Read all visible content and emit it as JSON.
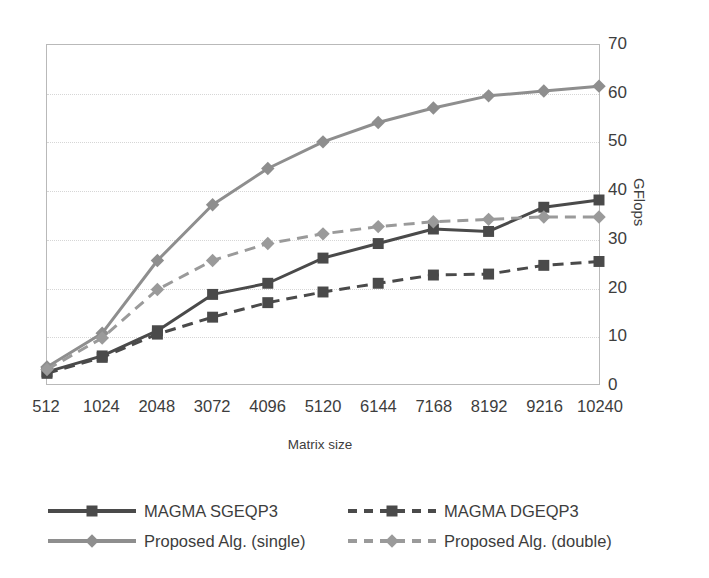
{
  "chart_data": {
    "type": "line",
    "title": "",
    "xlabel": "Matrix size",
    "ylabel": "GFlops",
    "grid": true,
    "legend_position": "bottom",
    "ylim": [
      0,
      70
    ],
    "ytick_step": 10,
    "yticks": [
      "70",
      "60",
      "50",
      "40",
      "30",
      "20",
      "10",
      "0"
    ],
    "categories": [
      "512",
      "1024",
      "2048",
      "3072",
      "4096",
      "5120",
      "6144",
      "7168",
      "8192",
      "9216",
      "10240"
    ],
    "series": [
      {
        "name": "MAGMA SGEQP3",
        "color": "#4a4a4a",
        "dash": "solid",
        "marker": "square",
        "values": [
          2.5,
          5.8,
          11.0,
          18.5,
          20.8,
          26.0,
          29.0,
          32.0,
          31.5,
          36.5,
          38.0
        ]
      },
      {
        "name": "MAGMA DGEQP3",
        "color": "#4a4a4a",
        "dash": "dashed",
        "marker": "square",
        "values": [
          2.2,
          5.5,
          10.3,
          13.8,
          16.8,
          19.0,
          20.8,
          22.5,
          22.7,
          24.5,
          25.3
        ]
      },
      {
        "name": "Proposed Alg. (single)",
        "color": "#8e8e8e",
        "dash": "solid",
        "marker": "diamond",
        "values": [
          3.5,
          10.5,
          25.5,
          37.0,
          44.5,
          50.0,
          54.0,
          57.0,
          59.5,
          60.5,
          61.5
        ]
      },
      {
        "name": "Proposed Alg. (double)",
        "color": "#9a9a9a",
        "dash": "dashed",
        "marker": "diamond",
        "values": [
          3.0,
          9.5,
          19.5,
          25.5,
          29.0,
          31.0,
          32.5,
          33.5,
          34.0,
          34.5,
          34.5
        ]
      }
    ]
  },
  "axes": {
    "y_title": "GFlops",
    "x_title": "Matrix size"
  },
  "legend": {
    "items": [
      {
        "label": "MAGMA SGEQP3"
      },
      {
        "label": "MAGMA DGEQP3"
      },
      {
        "label": "Proposed Alg. (single)"
      },
      {
        "label": "Proposed Alg. (double)"
      }
    ]
  },
  "colors": {
    "dark_series": "#4a4a4a",
    "light_series": "#8e8e8e",
    "grid": "#d6d6d6",
    "axis_border": "#b9b9b9",
    "text": "#3d3d3d",
    "background": "#ffffff"
  }
}
